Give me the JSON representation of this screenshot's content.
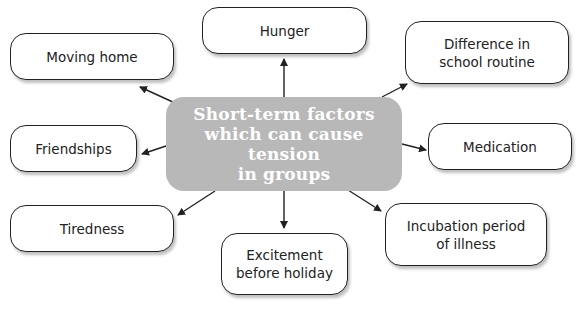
{
  "center": {
    "lines": [
      "Short-term factors",
      "which can cause tension",
      "in groups"
    ],
    "color": "#b8b8b8"
  },
  "factors": [
    {
      "id": "hunger",
      "lines": [
        "Hunger"
      ]
    },
    {
      "id": "moving-home",
      "lines": [
        "Moving home"
      ]
    },
    {
      "id": "difference-school-routine",
      "lines": [
        "Difference in",
        "school routine"
      ]
    },
    {
      "id": "friendships",
      "lines": [
        "Friendships"
      ]
    },
    {
      "id": "medication",
      "lines": [
        "Medication"
      ]
    },
    {
      "id": "tiredness",
      "lines": [
        "Tiredness"
      ]
    },
    {
      "id": "excitement-before-holiday",
      "lines": [
        "Excitement",
        "before holiday"
      ]
    },
    {
      "id": "incubation-period",
      "lines": [
        "Incubation period",
        "of illness"
      ]
    }
  ]
}
